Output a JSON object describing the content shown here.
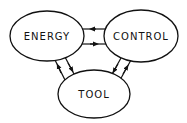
{
  "diagram": {
    "nodes": [
      {
        "id": "energy",
        "label": "ENERGY"
      },
      {
        "id": "control",
        "label": "CONTROL"
      },
      {
        "id": "tool",
        "label": "TOOL"
      }
    ],
    "edges": [
      {
        "from": "control",
        "to": "energy"
      },
      {
        "from": "energy",
        "to": "control"
      },
      {
        "from": "tool",
        "to": "energy"
      },
      {
        "from": "energy",
        "to": "tool"
      },
      {
        "from": "control",
        "to": "tool"
      },
      {
        "from": "tool",
        "to": "control"
      }
    ],
    "colors": {
      "stroke": "#111111",
      "background": "#ffffff"
    }
  }
}
